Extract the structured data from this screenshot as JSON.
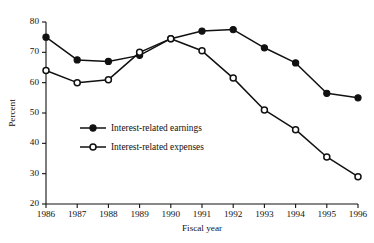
{
  "chart_data": {
    "type": "line",
    "title": "",
    "xlabel": "Fiscal year",
    "ylabel": "Percent",
    "x": [
      1986,
      1987,
      1988,
      1989,
      1990,
      1991,
      1992,
      1993,
      1994,
      1995,
      1996
    ],
    "xtick_labels": [
      "1986",
      "1987",
      "1988",
      "1989",
      "1990",
      "1991",
      "1992",
      "1993",
      "1994",
      "1995",
      "1996"
    ],
    "ytick_labels": [
      "20",
      "30",
      "40",
      "50",
      "60",
      "70",
      "80"
    ],
    "yticks": [
      20,
      30,
      40,
      50,
      60,
      70,
      80
    ],
    "ylim": [
      20,
      80
    ],
    "xlim": [
      1986,
      1996
    ],
    "grid": false,
    "legend_position": "center-left-inside",
    "series": [
      {
        "name": "Interest-related earnings",
        "marker": "filled-circle",
        "values": [
          75.0,
          67.5,
          67.0,
          69.0,
          74.5,
          77.0,
          77.5,
          71.5,
          66.5,
          56.5,
          55.0
        ]
      },
      {
        "name": "Interest-related expenses",
        "marker": "open-circle",
        "values": [
          64.0,
          60.0,
          61.0,
          70.0,
          74.5,
          70.5,
          61.5,
          51.0,
          44.5,
          35.5,
          29.0
        ]
      }
    ],
    "colors": {
      "line": "#111111",
      "marker_fill_filled": "#111111",
      "marker_fill_open": "#ffffff",
      "background": "#ffffff"
    }
  },
  "legend": {
    "entries": [
      {
        "label": "Interest-related earnings",
        "marker": "filled-circle"
      },
      {
        "label": "Interest-related expenses",
        "marker": "open-circle"
      }
    ]
  }
}
